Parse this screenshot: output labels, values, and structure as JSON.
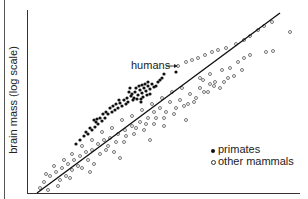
{
  "chart_data": {
    "type": "scatter",
    "title": "",
    "xlabel": "",
    "ylabel": "brain mass (log scale)",
    "grid": false,
    "legend_position": "lower right",
    "legend": [
      {
        "label": "primates",
        "marker": "filled circle"
      },
      {
        "label": "other mammals",
        "marker": "open circle"
      }
    ],
    "annotations": [
      {
        "text": "humans",
        "arrow_to": [
          178,
          66
        ]
      }
    ],
    "regression_line": {
      "x1": 37,
      "y1": 193,
      "x2": 280,
      "y2": 13
    },
    "series": [
      {
        "name": "primates",
        "marker": "filled",
        "points": [
          [
            132,
            94
          ],
          [
            135,
            92
          ],
          [
            138,
            95
          ],
          [
            140,
            90
          ],
          [
            142,
            93
          ],
          [
            144,
            88
          ],
          [
            146,
            91
          ],
          [
            148,
            86
          ],
          [
            150,
            89
          ],
          [
            147,
            95
          ],
          [
            152,
            84
          ],
          [
            154,
            87
          ],
          [
            143,
            97
          ],
          [
            137,
            99
          ],
          [
            133,
            100
          ],
          [
            128,
            102
          ],
          [
            126,
            104
          ],
          [
            122,
            106
          ],
          [
            120,
            103
          ],
          [
            118,
            108
          ],
          [
            115,
            110
          ],
          [
            112,
            112
          ],
          [
            108,
            114
          ],
          [
            105,
            118
          ],
          [
            102,
            121
          ],
          [
            98,
            124
          ],
          [
            95,
            127
          ],
          [
            92,
            130
          ],
          [
            88,
            134
          ],
          [
            110,
            108
          ],
          [
            100,
            118
          ],
          [
            96,
            122
          ],
          [
            90,
            128
          ],
          [
            86,
            132
          ],
          [
            131,
            96
          ],
          [
            141,
            99
          ],
          [
            156,
            86
          ],
          [
            158,
            82
          ],
          [
            160,
            80
          ],
          [
            136,
            88
          ],
          [
            124,
            100
          ],
          [
            116,
            104
          ],
          [
            106,
            112
          ],
          [
            94,
            120
          ],
          [
            84,
            136
          ],
          [
            80,
            140
          ],
          [
            76,
            144
          ],
          [
            145,
            84
          ],
          [
            139,
            86
          ],
          [
            129,
            92
          ],
          [
            134,
            98
          ],
          [
            150,
            94
          ],
          [
            162,
            78
          ],
          [
            164,
            74
          ],
          [
            141,
            102
          ],
          [
            127,
            98
          ],
          [
            119,
            100
          ],
          [
            113,
            106
          ],
          [
            103,
            114
          ],
          [
            97,
            119
          ],
          [
            176,
            72
          ],
          [
            142,
            85
          ],
          [
            148,
            82
          ],
          [
            130,
            88
          ]
        ]
      },
      {
        "name": "other mammals",
        "marker": "open",
        "points": [
          [
            178,
            66
          ],
          [
            186,
            62
          ],
          [
            192,
            60
          ],
          [
            198,
            58
          ],
          [
            205,
            55
          ],
          [
            212,
            52
          ],
          [
            218,
            50
          ],
          [
            226,
            48
          ],
          [
            236,
            44
          ],
          [
            244,
            40
          ],
          [
            250,
            36
          ],
          [
            258,
            30
          ],
          [
            264,
            26
          ],
          [
            272,
            22
          ],
          [
            290,
            32
          ],
          [
            266,
            52
          ],
          [
            273,
            51
          ],
          [
            200,
            78
          ],
          [
            210,
            74
          ],
          [
            222,
            70
          ],
          [
            230,
            68
          ],
          [
            238,
            62
          ],
          [
            244,
            58
          ],
          [
            250,
            55
          ],
          [
            203,
            80
          ],
          [
            215,
            82
          ],
          [
            228,
            78
          ],
          [
            220,
            88
          ],
          [
            208,
            92
          ],
          [
            196,
            98
          ],
          [
            188,
            104
          ],
          [
            180,
            100
          ],
          [
            170,
            102
          ],
          [
            160,
            108
          ],
          [
            154,
            112
          ],
          [
            148,
            118
          ],
          [
            140,
            122
          ],
          [
            132,
            126
          ],
          [
            125,
            130
          ],
          [
            118,
            134
          ],
          [
            110,
            138
          ],
          [
            104,
            140
          ],
          [
            98,
            144
          ],
          [
            92,
            150
          ],
          [
            86,
            152
          ],
          [
            80,
            156
          ],
          [
            74,
            160
          ],
          [
            68,
            164
          ],
          [
            62,
            168
          ],
          [
            56,
            172
          ],
          [
            50,
            176
          ],
          [
            44,
            182
          ],
          [
            40,
            188
          ],
          [
            48,
            190
          ],
          [
            66,
            176
          ],
          [
            72,
            170
          ],
          [
            78,
            166
          ],
          [
            88,
            160
          ],
          [
            100,
            154
          ],
          [
            108,
            146
          ],
          [
            116,
            142
          ],
          [
            126,
            136
          ],
          [
            136,
            128
          ],
          [
            146,
            124
          ],
          [
            156,
            118
          ],
          [
            166,
            112
          ],
          [
            176,
            108
          ],
          [
            190,
            94
          ],
          [
            200,
            88
          ],
          [
            210,
            84
          ],
          [
            60,
            180
          ],
          [
            70,
            178
          ],
          [
            82,
            168
          ],
          [
            94,
            164
          ],
          [
            106,
            150
          ],
          [
            114,
            152
          ],
          [
            124,
            142
          ],
          [
            134,
            134
          ],
          [
            144,
            130
          ],
          [
            154,
            124
          ],
          [
            164,
            118
          ],
          [
            174,
            114
          ],
          [
            184,
            106
          ],
          [
            194,
            102
          ],
          [
            204,
            92
          ],
          [
            214,
            86
          ],
          [
            224,
            82
          ],
          [
            234,
            76
          ],
          [
            242,
            70
          ],
          [
            182,
            88
          ],
          [
            172,
            92
          ],
          [
            162,
            98
          ],
          [
            152,
            104
          ],
          [
            142,
            110
          ],
          [
            132,
            116
          ],
          [
            122,
            120
          ],
          [
            112,
            128
          ],
          [
            102,
            132
          ],
          [
            92,
            140
          ],
          [
            82,
            146
          ],
          [
            72,
            154
          ],
          [
            64,
            160
          ],
          [
            54,
            166
          ],
          [
            46,
            174
          ],
          [
            58,
            186
          ],
          [
            90,
            172
          ],
          [
            120,
            158
          ],
          [
            150,
            140
          ],
          [
            186,
            120
          ],
          [
            164,
            126
          ]
        ]
      }
    ]
  },
  "chart": {
    "ylabel": "brain mass (log scale)",
    "annotation_humans": "humans",
    "legend_primates": "primates",
    "legend_other": "other mammals"
  }
}
